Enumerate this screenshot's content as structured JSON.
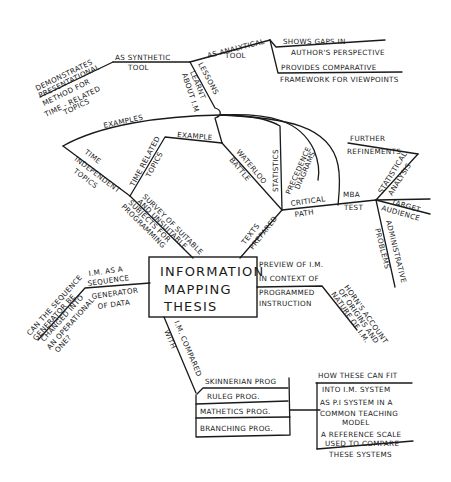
{
  "central": {
    "line1": "INFORMATION",
    "line2": "MAPPING",
    "line3": "THESIS"
  },
  "branches": {
    "synthetic_tool": {
      "label1": "AS SYNTHETIC",
      "label2": "TOOL",
      "leaf1": "DEMONSTRATES",
      "leaf2": "PRESENTATIONAL",
      "leaf3": "METHOD FOR",
      "leaf4": "TIME - RELATED",
      "leaf5": "TOPICS"
    },
    "analytical_tool": {
      "label1": "AS ANALYTICAL",
      "label2": "TOOL",
      "leaf_a1": "SHOWS GAPS IN",
      "leaf_a2": "AUTHOR'S PERSPECTIVE",
      "leaf_b1": "PROVIDES COMPARATIVE",
      "leaf_b2": "FRAMEWORK FOR VIEWPOINTS"
    },
    "lessons": {
      "label1": "LESSONS",
      "label2": "LEARNT",
      "label3": "ABOUT I.M"
    },
    "examples": {
      "label": "EXAMPLES",
      "time_independent1": "TIME",
      "time_independent2": "INDEPENDENT",
      "time_independent3": "TOPICS",
      "time_related1": "TIME RELATED",
      "time_related2": "TOPICS",
      "example": "EXAMPLE",
      "waterloo1": "WATERLOO",
      "waterloo2": "BATTLE"
    },
    "survey": {
      "line1": "SURVEY OF SUITABLE",
      "line2": "AND UNSUITABLE",
      "line3": "SUBJECTS FOR",
      "line4": "PROGRAMMING"
    },
    "texts_prepared": {
      "label1": "TEXTS",
      "label2": "PREPARED",
      "statistics": "STATISTICS",
      "precedence1": "PRECEDENCE",
      "precedence2": "DIAGRAMS",
      "critical1": "CRITICAL",
      "critical2": "PATH"
    },
    "mba_test": {
      "label1": "MBA",
      "label2": "TEST",
      "further1": "FURTHER",
      "further2": "REFINEMENTS",
      "statistical1": "STATISTICAL",
      "statistical2": "ANALYSIS",
      "target1": "TARGET",
      "target2": "AUDIENCE",
      "admin1": "ADMINISTRATIVE",
      "admin2": "PROBLEMS"
    },
    "sequence_generator": {
      "label1": "I.M. AS A",
      "label2": "SEQUENCE",
      "label3": "GENERATOR",
      "label4": "OF DATA",
      "q1": "CAN THE SEQUENCE",
      "q2": "GENERATOR BE",
      "q3": "CHANGED INTO",
      "q4": "AN OPERATIONAL",
      "q5": "ONE?"
    },
    "programmed_instruction": {
      "label1": "PREVIEW OF I.M.",
      "label2": "IN CONTEXT OF",
      "label3": "PROGRAMMED",
      "label4": "INSTRUCTION",
      "horn1": "HORN'S ACCOUNT",
      "horn2": "OF ORIGINS AND",
      "horn3": "NATURE OF I.M."
    },
    "compared": {
      "label1": "I.M. COMPARED",
      "label2": "WITH",
      "skinnerian": "SKINNERIAN PROG",
      "items": [
        "RULEG PROG.",
        "MATHETICS PROG.",
        "BRANCHING PROG."
      ]
    },
    "fit": {
      "header": "HOW THESE CAN FIT",
      "item1": "INTO I.M. SYSTEM",
      "item2a": "AS P.I SYSTEM IN A",
      "item2b": "COMMON TEACHING",
      "item2c": "MODEL",
      "item3a": "A REFERENCE SCALE",
      "item3b": "USED TO COMPARE",
      "item3c": "THESE SYSTEMS"
    }
  },
  "colors": {
    "ink": "#1a1a1a",
    "paper": "#ffffff"
  }
}
